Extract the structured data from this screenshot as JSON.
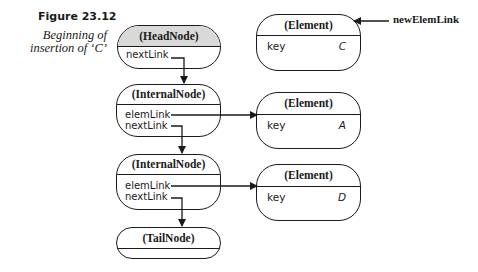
{
  "caption": {
    "figure": "Figure 23.12",
    "line1": "Beginning of",
    "line2": "insertion of ‘C’"
  },
  "list_nodes": [
    {
      "type": "(HeadNode)",
      "fields": [
        "nextLink"
      ]
    },
    {
      "type": "(InternalNode)",
      "fields": [
        "elemLink",
        "nextLink"
      ]
    },
    {
      "type": "(InternalNode)",
      "fields": [
        "elemLink",
        "nextLink"
      ]
    },
    {
      "type": "(TailNode)",
      "fields": []
    }
  ],
  "elements": [
    {
      "type": "(Element)",
      "field": "key",
      "value": "C"
    },
    {
      "type": "(Element)",
      "field": "key",
      "value": "A"
    },
    {
      "type": "(Element)",
      "field": "key",
      "value": "D"
    }
  ],
  "external_pointer": {
    "label": "newElemLink",
    "target": "Element C"
  },
  "colors": {
    "ink": "#1a1a1a",
    "head_fill": "#d9d9d9",
    "background": "#ffffff"
  }
}
